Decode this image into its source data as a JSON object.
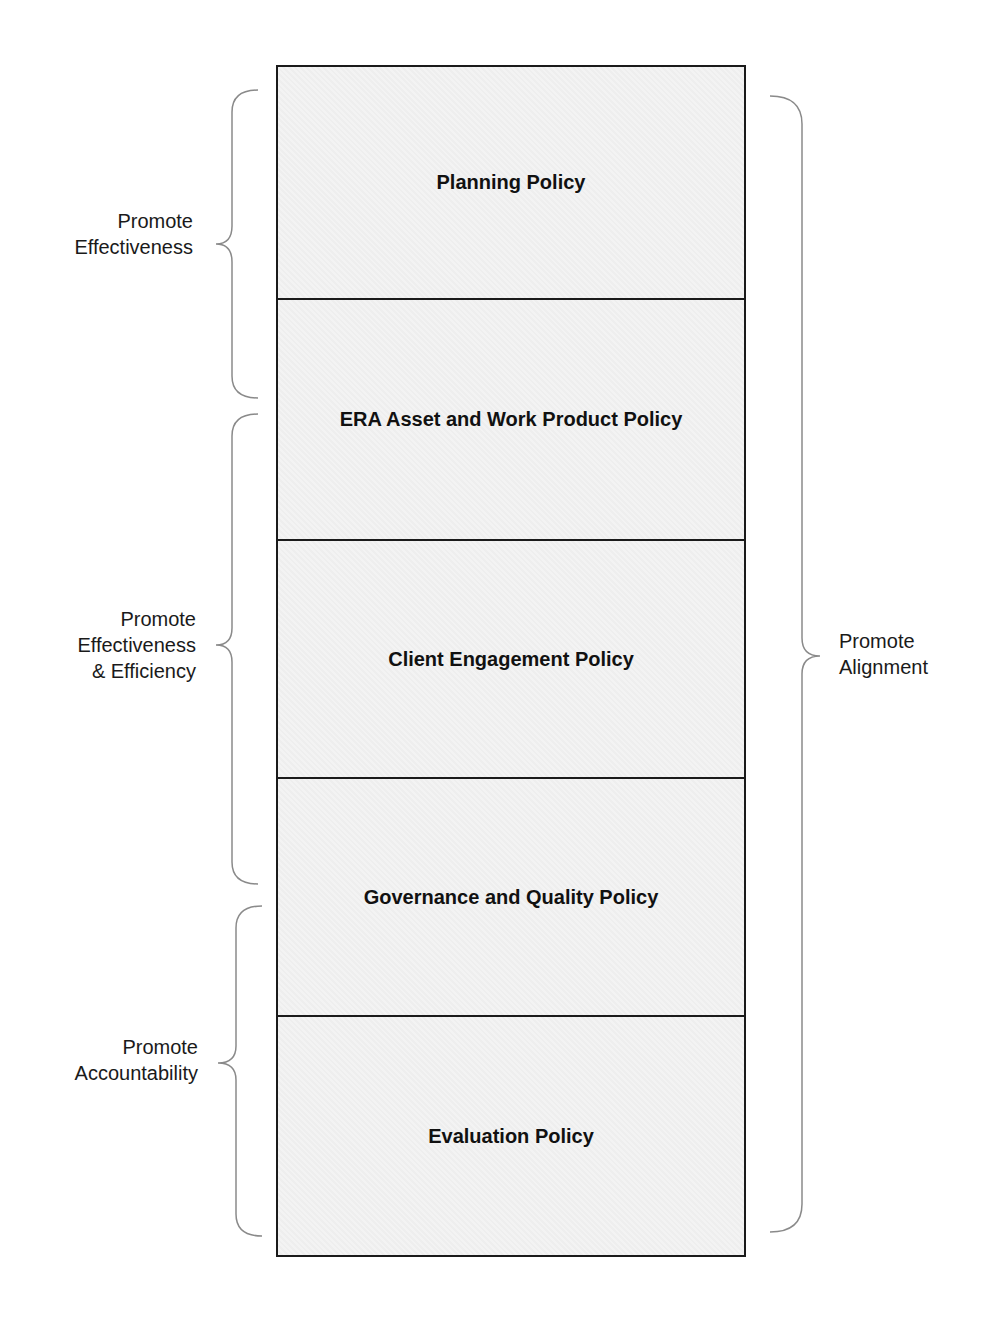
{
  "policies": [
    {
      "label": "Planning Policy"
    },
    {
      "label": "ERA Asset and Work Product Policy"
    },
    {
      "label": "Client Engagement Policy"
    },
    {
      "label": "Governance and Quality Policy"
    },
    {
      "label": "Evaluation Policy"
    }
  ],
  "left_groups": [
    {
      "lines": [
        "Promote",
        "Effectiveness"
      ]
    },
    {
      "lines": [
        "Promote",
        "Effectiveness",
        "& Efficiency"
      ]
    },
    {
      "lines": [
        "Promote",
        "Accountability"
      ]
    }
  ],
  "right_group": {
    "lines": [
      "Promote",
      "Alignment"
    ]
  },
  "colors": {
    "border": "#1a1a1a",
    "fill": "#f1f1f1",
    "brace": "#888888",
    "text": "#111111"
  }
}
